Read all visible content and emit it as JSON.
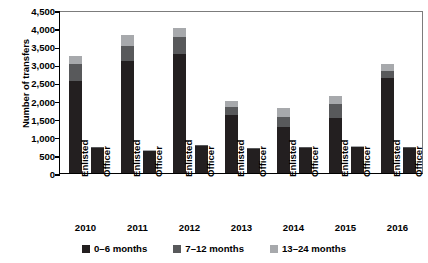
{
  "chart_data": {
    "type": "bar",
    "stacked": true,
    "title": "",
    "xlabel": "",
    "ylabel": "Number of transfers",
    "ylim": [
      0,
      4500
    ],
    "ytick_values": [
      0,
      500,
      1000,
      1500,
      2000,
      2500,
      3000,
      3500,
      4000,
      4500
    ],
    "ytick_labels": [
      "0",
      "500",
      "1,000",
      "1,500",
      "2,000",
      "2,500",
      "3,000",
      "3,500",
      "4,000",
      "4,500"
    ],
    "grid": false,
    "legend_position": "bottom",
    "groups": [
      "2010",
      "2011",
      "2012",
      "2013",
      "2014",
      "2015",
      "2016"
    ],
    "subcategories": [
      "Enlisted",
      "Officer"
    ],
    "categories": [
      "2010 Enlisted",
      "2010 Officer",
      "2011 Enlisted",
      "2011 Officer",
      "2012 Enlisted",
      "2012 Officer",
      "2013 Enlisted",
      "2013 Officer",
      "2014 Enlisted",
      "2014 Officer",
      "2015 Enlisted",
      "2015 Officer",
      "2016 Enlisted",
      "2016 Officer"
    ],
    "series": [
      {
        "name": "0–6 months",
        "color": "#231f20",
        "values": [
          2540,
          700,
          3090,
          600,
          3290,
          740,
          1610,
          670,
          1270,
          700,
          1530,
          710,
          2620,
          690
        ]
      },
      {
        "name": "7–12 months",
        "color": "#58595b",
        "values": [
          460,
          20,
          430,
          20,
          460,
          20,
          210,
          20,
          290,
          20,
          370,
          20,
          210,
          20
        ]
      },
      {
        "name": "13–24 months",
        "color": "#a7a9ac",
        "values": [
          230,
          10,
          290,
          10,
          260,
          10,
          170,
          10,
          230,
          10,
          240,
          10,
          170,
          10
        ]
      }
    ],
    "totals": [
      3230,
      730,
      3810,
      630,
      4010,
      770,
      1990,
      700,
      1790,
      730,
      2140,
      740,
      3000,
      720
    ]
  },
  "legend": {
    "items": [
      {
        "label": "0–6 months",
        "color": "#231f20",
        "swatch_name": "legend-swatch-0-6-months"
      },
      {
        "label": "7–12 months",
        "color": "#58595b",
        "swatch_name": "legend-swatch-7-12-months"
      },
      {
        "label": "13–24 months",
        "color": "#a7a9ac",
        "swatch_name": "legend-swatch-13-24-months"
      }
    ]
  },
  "axes": {
    "y_title": "Number of transfers"
  }
}
